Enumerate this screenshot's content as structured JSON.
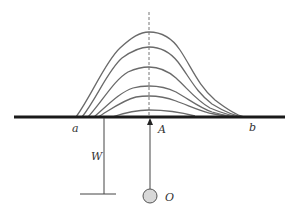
{
  "diagram": {
    "labels": {
      "a": "a",
      "b": "b",
      "A": "A",
      "W": "W",
      "O": "O"
    },
    "colors": {
      "curve": "#6a6a6a",
      "ground": "#1a1a1a",
      "source_fill": "#d8d8d8",
      "source_stroke": "#555555"
    },
    "curve_count": 6
  }
}
